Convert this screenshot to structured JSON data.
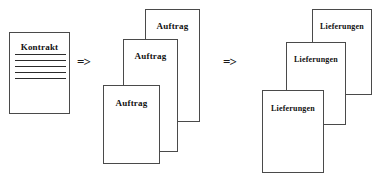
{
  "diagram": {
    "background_color": "#ffffff",
    "border_color": "#4a4a4a",
    "text_color": "#111111",
    "flow": [
      {
        "step": 1,
        "label": "Kontrakt",
        "count": 1
      },
      {
        "step": 2,
        "label": "Auftrag",
        "count": 3
      },
      {
        "step": 3,
        "label": "Lieferungen",
        "count": 3
      }
    ]
  },
  "kontrakt": {
    "title": "Kontrakt",
    "rules": [
      "",
      "",
      "",
      "",
      ""
    ]
  },
  "arrows": {
    "first": "=>",
    "second": "=>"
  },
  "auftrag": {
    "back": {
      "title": "Auftrag"
    },
    "mid": {
      "title": "Auftrag"
    },
    "front": {
      "title": "Auftrag"
    }
  },
  "lieferungen": {
    "back": {
      "title": "Lieferungen"
    },
    "mid": {
      "title": "Lieferungen"
    },
    "front": {
      "title": "Lieferungen"
    }
  }
}
